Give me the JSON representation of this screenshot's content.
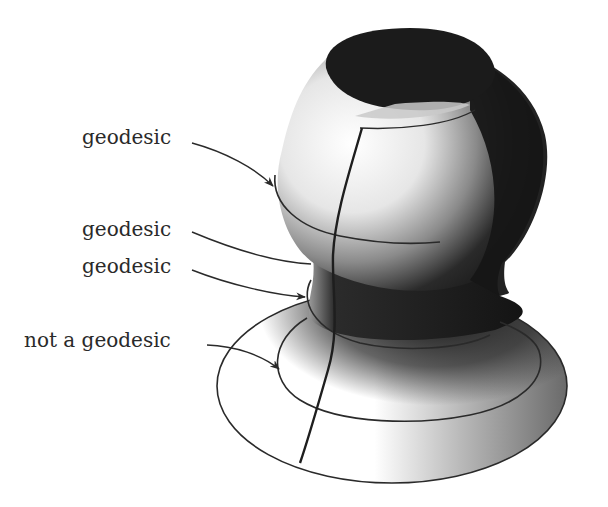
{
  "figure": {
    "colors": {
      "background": "#ffffff",
      "ink": "#222222",
      "surface_light": "#f4f4f4",
      "surface_dark": "#1c1c1c"
    },
    "labels": [
      {
        "id": "label-1",
        "text": "geodesic",
        "target": "upper latitude circle on bulb"
      },
      {
        "id": "label-2",
        "text": "geodesic",
        "target": "top edge of neck"
      },
      {
        "id": "label-3",
        "text": "geodesic",
        "target": "narrowest circle of neck"
      },
      {
        "id": "label-4",
        "text": "not a geodesic",
        "target": "inner circle on flared base"
      }
    ],
    "curves": [
      {
        "name": "meridian",
        "kind": "geodesic"
      },
      {
        "name": "bulb-equator",
        "kind": "geodesic"
      },
      {
        "name": "neck-circle",
        "kind": "geodesic"
      },
      {
        "name": "base-inner-circle",
        "kind": "not a geodesic"
      },
      {
        "name": "base-rim",
        "kind": "boundary"
      },
      {
        "name": "top-opening-rim",
        "kind": "boundary"
      }
    ]
  }
}
